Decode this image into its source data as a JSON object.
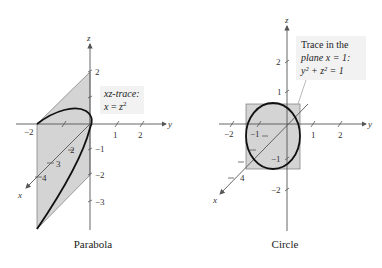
{
  "left_figure": {
    "caption": "Parabola",
    "annotation": {
      "line1": "xz-trace:",
      "line2_lhs": "x",
      "line2_eq": " = ",
      "line2_rhs": "z",
      "line2_exp": "2"
    },
    "axis_labels": {
      "x": "x",
      "y": "y",
      "z": "z"
    },
    "y_ticks": [
      "−2",
      "1",
      "2"
    ],
    "z_ticks": [
      "2",
      "−1",
      "−2",
      "−3"
    ],
    "x_ticks": [
      "2",
      "3",
      "4"
    ]
  },
  "right_figure": {
    "caption": "Circle",
    "annotation": {
      "line1": "Trace in the",
      "line2": "plane x = 1:",
      "line3": "y² + z² = 1"
    },
    "axis_labels": {
      "x": "x",
      "y": "y",
      "z": "z"
    },
    "y_ticks": [
      "−2",
      "−1",
      "1",
      "2"
    ],
    "z_ticks": [
      "2",
      "1",
      "−1",
      "−2"
    ],
    "x_ticks": [
      "4"
    ]
  },
  "colors": {
    "shade": "#d4d4d4",
    "curve": "#111111",
    "axis": "#555555"
  }
}
